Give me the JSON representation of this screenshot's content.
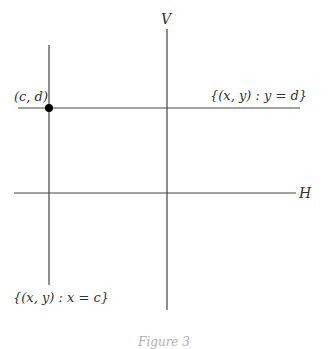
{
  "diagram": {
    "axes": {
      "vertical_label": "V",
      "horizontal_label": "H"
    },
    "point_label": "(c, d)",
    "horizontal_line_label": "{(x, y) : y = d}",
    "vertical_line_label": "{(x, y) : x = c}",
    "caption": "Figure 3",
    "colors": {
      "line": "#333333",
      "point": "#000000",
      "caption": "#b0b0b0"
    }
  }
}
